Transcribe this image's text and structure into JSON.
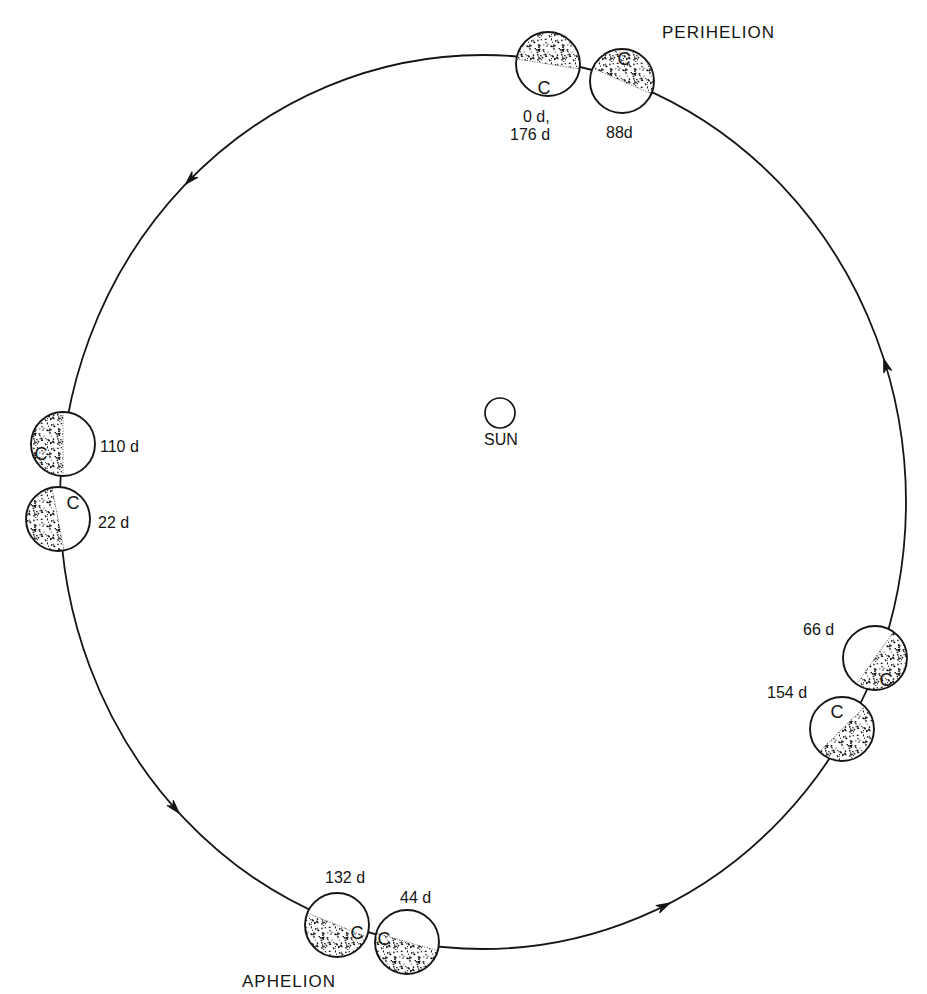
{
  "figure": {
    "sun_label": "SUN",
    "perihelion_label": "PERIHELION",
    "aphelion_label": "APHELION",
    "orbit_direction": "counterclockwise",
    "reference_mark": "C"
  },
  "planets": [
    {
      "name": "0d-176d",
      "days": [
        0,
        176
      ],
      "label_lines": [
        "0 d,",
        "176 d"
      ],
      "marker": "C",
      "shaded_side": "top"
    },
    {
      "name": "88d",
      "days": [
        88
      ],
      "label": "88d",
      "marker": "C",
      "shaded_side": "top"
    },
    {
      "name": "110d",
      "days": [
        110
      ],
      "label": "110 d",
      "marker": "C",
      "shaded_side": "left"
    },
    {
      "name": "22d",
      "days": [
        22
      ],
      "label": "22 d",
      "marker": "C",
      "shaded_side": "left"
    },
    {
      "name": "66d",
      "days": [
        66
      ],
      "label": "66 d",
      "marker": "C",
      "shaded_side": "lower-right"
    },
    {
      "name": "154d",
      "days": [
        154
      ],
      "label": "154 d",
      "marker": "C",
      "shaded_side": "lower-right"
    },
    {
      "name": "132d",
      "days": [
        132
      ],
      "label": "132 d",
      "marker": "C",
      "shaded_side": "bottom"
    },
    {
      "name": "44d",
      "days": [
        44
      ],
      "label": "44 d",
      "marker": "C",
      "shaded_side": "bottom"
    }
  ]
}
